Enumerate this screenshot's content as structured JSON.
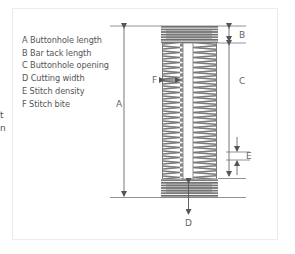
{
  "cut_text": [
    "t",
    "n"
  ],
  "legend": [
    {
      "key": "A",
      "text": "A Buttonhole length"
    },
    {
      "key": "B",
      "text": "B Bar tack length"
    },
    {
      "key": "C",
      "text": "C Buttonhole opening"
    },
    {
      "key": "D",
      "text": "D Cutting width"
    },
    {
      "key": "E",
      "text": "E Stitch density"
    },
    {
      "key": "F",
      "text": "F Stitch bite"
    }
  ],
  "labels": {
    "A": "A",
    "B": "B",
    "C": "C",
    "D": "D",
    "E": "E",
    "F": "F"
  },
  "colors": {
    "line": "#666666",
    "stitch": "#777777",
    "bar": "#6e6e6e",
    "frame": "#ececec",
    "text": "#555555"
  }
}
